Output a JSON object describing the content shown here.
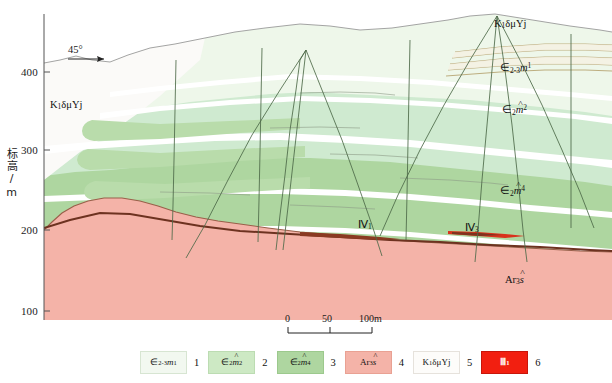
{
  "figure": {
    "kind": "geological-cross-section",
    "background": "#ffffff"
  },
  "axis": {
    "title": "标高/m",
    "ticks": [
      "400",
      "300",
      "200",
      "100"
    ],
    "tick_values": [
      400,
      300,
      200,
      100
    ],
    "line_color": "#555555"
  },
  "annotations": {
    "angle": "45°",
    "dike_label_left": "K₁δμYj",
    "dike_label_right": "K₁δμYj",
    "unit_m1": "∈₂₋₃m¹",
    "unit_m2": "∈₂m̂²",
    "unit_m4": "∈₂m̂⁴",
    "unit_ar": "Ar₃ŝ",
    "ore_iii1": "Ⅲ₁",
    "ore_iii3": "Ⅲ₃"
  },
  "scale_bar": {
    "labels": [
      "0",
      "50",
      "100m"
    ],
    "values": [
      0,
      50,
      100
    ],
    "unit": "m"
  },
  "legend": {
    "items": [
      {
        "number": "1",
        "label_html": "∈<sub>2-3</sub><i>m</i><sup>1</sup>",
        "fill": "#f2f8f0",
        "border": "#d7e5d2",
        "name": "legend-unit-m1"
      },
      {
        "number": "2",
        "label_html": "∈<sub>2</sub><i class=\"hat\">m</i><sup>2</sup>",
        "fill": "#cde9c4",
        "border": "#bcdcb2",
        "name": "legend-unit-m2"
      },
      {
        "number": "3",
        "label_html": "∈<sub>2</sub><i class=\"hat\">m</i><sup>4</sup>",
        "fill": "#aed6a0",
        "border": "#9cc98d",
        "name": "legend-unit-m4"
      },
      {
        "number": "4",
        "label_html": "Ar<sub>3</sub><i class=\"hat\">s</i>",
        "fill": "#f4b3a8",
        "border": "#e9a193",
        "name": "legend-unit-archean"
      },
      {
        "number": "5",
        "label_html": "K<sub>1</sub>δμYj",
        "fill": "#fdfcfa",
        "border": "#e6e2dc",
        "name": "legend-unit-dike"
      },
      {
        "number": "6",
        "label_html": "Ⅲ<sub>1</sub>",
        "fill": "#f21f10",
        "border": "#c8150a",
        "name": "legend-orebody"
      }
    ]
  },
  "chart_data": {
    "type": "area",
    "title": "",
    "xlabel": "",
    "ylabel": "标高/m",
    "ylim": [
      90,
      430
    ],
    "colors": {
      "unit_m1_light": "#eaf5e6",
      "unit_m1_pale": "#f2f8f0",
      "unit_m2": "#cde9c4",
      "unit_m4": "#aed6a0",
      "archean": "#f4b3a8",
      "dike_white": "#fbfaf8",
      "dike_stripe": "#b8a878",
      "orebody_red": "#e4301c",
      "orebody_dark": "#7a3b28",
      "drill_line": "#4f6b4a",
      "axis": "#555555"
    },
    "units": [
      {
        "name": "∈₂₋₃m¹",
        "color": "#eaf5e6",
        "legend_index": 1
      },
      {
        "name": "∈₂m̂²",
        "color": "#cde9c4",
        "legend_index": 2
      },
      {
        "name": "∈₂m̂⁴",
        "color": "#aed6a0",
        "legend_index": 3
      },
      {
        "name": "Ar₃ŝ",
        "color": "#f4b3a8",
        "legend_index": 4
      },
      {
        "name": "K₁δμYj",
        "color": "#fbfaf8",
        "legend_index": 5
      },
      {
        "name": "Ⅲ₁",
        "color": "#e4301c",
        "legend_index": 6
      }
    ],
    "orebodies": [
      {
        "label": "Ⅲ₁",
        "elevation": 205
      },
      {
        "label": "Ⅲ₃",
        "elevation": 212
      }
    ]
  }
}
